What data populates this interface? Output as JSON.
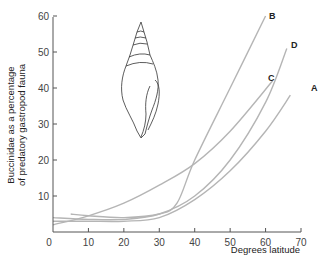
{
  "chart_data": {
    "type": "line",
    "title": "",
    "xlabel": "Degrees latitude",
    "ylabel": "Buccinidae as a percentage of predatory gastropod fauna",
    "ylabel_lines": [
      "Buccinidae as a percentage",
      "of predatory gastropod fauna"
    ],
    "xlim": [
      0,
      70
    ],
    "ylim": [
      0,
      60
    ],
    "xticks": [
      0,
      10,
      20,
      30,
      40,
      50,
      60,
      70
    ],
    "yticks": [
      10,
      20,
      30,
      40,
      50,
      60
    ],
    "grid": false,
    "legend": "curve labels at line ends",
    "series": [
      {
        "name": "A",
        "x": [
          0,
          10,
          20,
          30,
          40,
          50,
          60,
          67
        ],
        "y": [
          3,
          3,
          3,
          4,
          9,
          17,
          28,
          38
        ]
      },
      {
        "name": "B",
        "x": [
          5,
          10,
          20,
          30,
          35,
          40,
          50,
          60
        ],
        "y": [
          5,
          4.5,
          4,
          5,
          8,
          20,
          40,
          60
        ]
      },
      {
        "name": "C",
        "x": [
          0,
          10,
          20,
          30,
          40,
          50,
          62
        ],
        "y": [
          2,
          4.5,
          8,
          13,
          19,
          28,
          42
        ]
      },
      {
        "name": "D",
        "x": [
          0,
          10,
          20,
          30,
          40,
          50,
          60,
          66
        ],
        "y": [
          4,
          3.5,
          3.5,
          5,
          10,
          20,
          36,
          51
        ]
      }
    ],
    "annotations": [
      "Illustration of a buccinid gastropod shell"
    ]
  },
  "axis": {
    "x_label": "Degrees latitude",
    "y_label_line1": "Buccinidae as a percentage",
    "y_label_line2": "of predatory gastropod fauna",
    "x_ticks": [
      "0",
      "10",
      "20",
      "30",
      "40",
      "50",
      "60",
      "70"
    ],
    "y_ticks": [
      "10",
      "20",
      "30",
      "40",
      "50",
      "60"
    ]
  },
  "curves": {
    "A": "A",
    "B": "B",
    "C": "C",
    "D": "D"
  },
  "colors": {
    "curve": "#b5b5b5",
    "axis": "#555555",
    "shell": "#333333"
  }
}
